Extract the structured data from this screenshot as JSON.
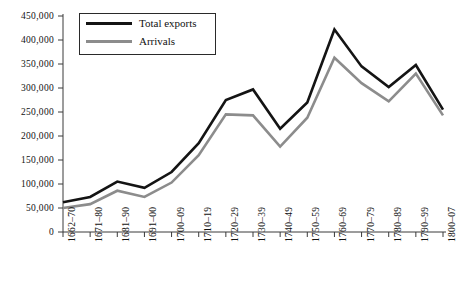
{
  "chart_data": {
    "type": "line",
    "title": "",
    "subtitle": "",
    "xlabel": "",
    "ylabel": "",
    "grid": false,
    "legend_position": "top-left",
    "ylim": [
      0,
      450000
    ],
    "ytick_values": [
      0,
      50000,
      100000,
      150000,
      200000,
      250000,
      300000,
      350000,
      400000,
      450000
    ],
    "ytick_labels": [
      "0",
      "50,000",
      "100,000",
      "150,000",
      "200,000",
      "250,000",
      "300,000",
      "350,000",
      "400,000",
      "450,000"
    ],
    "categories": [
      "1662–70",
      "1671–80",
      "1681–90",
      "1691–1700",
      "1700–09",
      "1710–19",
      "1720–29",
      "1730–39",
      "1740–49",
      "1750–59",
      "1760–69",
      "1770–79",
      "1780–89",
      "1790–99",
      "1800–07"
    ],
    "xtick_labels": [
      "1662–70",
      "1671–80",
      "1681–90",
      "1691–00",
      "1700–09",
      "1710–19",
      "1720–29",
      "1730–39",
      "1740–49",
      "1750–59",
      "1760–69",
      "1770–79",
      "1780–89",
      "1790–99",
      "1800–07"
    ],
    "series": [
      {
        "name": "Total exports",
        "color": "#141414",
        "width": 2.6,
        "values": [
          62000,
          73000,
          105000,
          92000,
          125000,
          185000,
          275000,
          297000,
          215000,
          270000,
          422000,
          345000,
          302000,
          348000,
          255000
        ]
      },
      {
        "name": "Arrivals",
        "color": "#8c8c8c",
        "width": 2.6,
        "values": [
          50000,
          58000,
          86000,
          73000,
          103000,
          160000,
          245000,
          243000,
          178000,
          238000,
          363000,
          310000,
          272000,
          330000,
          243000
        ]
      }
    ]
  },
  "legend": {
    "items": [
      {
        "label": "Total exports"
      },
      {
        "label": "Arrivals"
      }
    ]
  },
  "colors": {
    "total_exports": "#141414",
    "arrivals": "#8c8c8c",
    "axis": "#3a3a3a",
    "text": "#111111",
    "background": "#ffffff"
  }
}
